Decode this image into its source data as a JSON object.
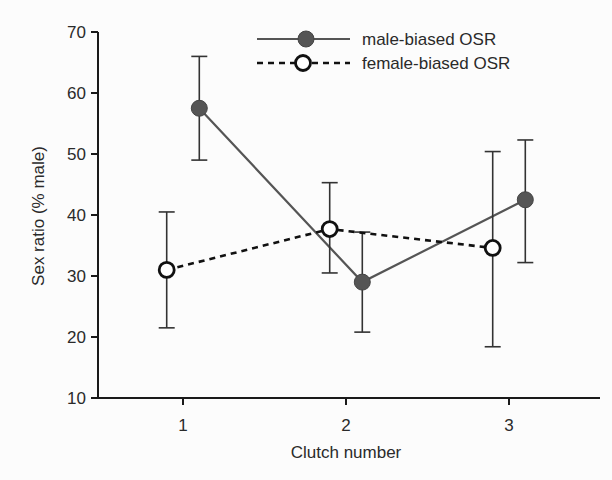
{
  "chart_data": {
    "type": "line",
    "title": "",
    "xlabel": "Clutch number",
    "ylabel": "Sex ratio (% male)",
    "ylim": [
      10,
      70
    ],
    "yticks": [
      10,
      20,
      30,
      40,
      50,
      60,
      70
    ],
    "xticks": [
      1,
      2,
      3
    ],
    "xtick_labels": [
      "1",
      "2",
      "3"
    ],
    "grid": false,
    "legend_position": "top-right",
    "series": [
      {
        "name": "male-biased OSR",
        "marker": "filled-circle",
        "line": "solid",
        "color": "#555555",
        "x": [
          1.1,
          2.1,
          3.1
        ],
        "values": [
          57.5,
          29,
          42.5
        ],
        "err_upper": [
          66,
          37.2,
          52.3
        ],
        "err_lower": [
          49,
          20.8,
          32.2
        ]
      },
      {
        "name": "female-biased OSR",
        "marker": "open-circle",
        "line": "dashed",
        "color": "#111111",
        "x": [
          0.9,
          1.9,
          2.9
        ],
        "values": [
          31,
          37.7,
          34.6
        ],
        "err_upper": [
          40.5,
          45.3,
          50.4
        ],
        "err_lower": [
          21.5,
          30.5,
          18.4
        ]
      }
    ]
  }
}
